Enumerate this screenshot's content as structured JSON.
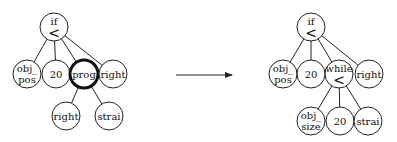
{
  "diagram": {
    "type": "tree-transformation",
    "arrow": {
      "x1": 176,
      "y1": 75,
      "x2": 232,
      "y2": 75,
      "color": "#222222"
    },
    "before": {
      "name": "original-tree",
      "nodes": [
        {
          "id": "if",
          "lines": [
            "if",
            "<"
          ],
          "x": 54,
          "y": 27,
          "r": 14
        },
        {
          "id": "obj_pos",
          "lines": [
            "obj_",
            "pos"
          ],
          "x": 27,
          "y": 74,
          "r": 14
        },
        {
          "id": "n20",
          "lines": [
            "20"
          ],
          "x": 56,
          "y": 74,
          "r": 14
        },
        {
          "id": "prog",
          "lines": [
            "prog"
          ],
          "x": 84,
          "y": 74,
          "r": 14,
          "highlight": true
        },
        {
          "id": "right",
          "lines": [
            "right"
          ],
          "x": 113,
          "y": 74,
          "r": 14
        },
        {
          "id": "right2",
          "lines": [
            "right"
          ],
          "x": 66,
          "y": 116,
          "r": 14
        },
        {
          "id": "strai",
          "lines": [
            "strai"
          ],
          "x": 109,
          "y": 116,
          "r": 14
        }
      ],
      "edges": [
        [
          "if",
          "obj_pos"
        ],
        [
          "if",
          "n20"
        ],
        [
          "if",
          "prog"
        ],
        [
          "if",
          "right"
        ],
        [
          "prog",
          "right2"
        ],
        [
          "prog",
          "strai"
        ]
      ]
    },
    "after": {
      "name": "transformed-tree",
      "nodes": [
        {
          "id": "if",
          "lines": [
            "if",
            "<"
          ],
          "x": 311,
          "y": 27,
          "r": 14
        },
        {
          "id": "obj_pos",
          "lines": [
            "obj_",
            "pos"
          ],
          "x": 283,
          "y": 74,
          "r": 14
        },
        {
          "id": "n20",
          "lines": [
            "20"
          ],
          "x": 311,
          "y": 74,
          "r": 14
        },
        {
          "id": "while",
          "lines": [
            "while",
            "<"
          ],
          "x": 339,
          "y": 74,
          "r": 14
        },
        {
          "id": "right",
          "lines": [
            "right"
          ],
          "x": 369,
          "y": 74,
          "r": 14
        },
        {
          "id": "obj_size",
          "lines": [
            "obj_",
            "size"
          ],
          "x": 311,
          "y": 121,
          "r": 14
        },
        {
          "id": "n20b",
          "lines": [
            "20"
          ],
          "x": 340,
          "y": 121,
          "r": 14
        },
        {
          "id": "strai",
          "lines": [
            "strai"
          ],
          "x": 368,
          "y": 121,
          "r": 14
        }
      ],
      "edges": [
        [
          "if",
          "obj_pos"
        ],
        [
          "if",
          "n20"
        ],
        [
          "if",
          "while"
        ],
        [
          "if",
          "right"
        ],
        [
          "while",
          "obj_size"
        ],
        [
          "while",
          "n20b"
        ],
        [
          "while",
          "strai"
        ]
      ]
    }
  }
}
